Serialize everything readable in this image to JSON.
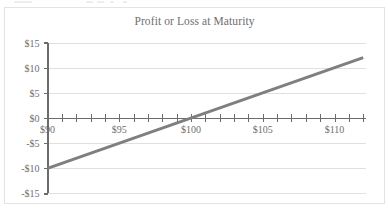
{
  "chart_data": {
    "type": "line",
    "title": "Profit or Loss at Maturity",
    "xlabel": "",
    "ylabel": "",
    "xlim": [
      90,
      112
    ],
    "ylim": [
      -15,
      15
    ],
    "grid": true,
    "legend": null,
    "x_tick_labels": [
      "$90",
      "$95",
      "$100",
      "$105",
      "$110"
    ],
    "x_tick_values": [
      90,
      95,
      100,
      105,
      110
    ],
    "x_minor_tick_step": 1,
    "y_tick_labels": [
      "$15",
      "$10",
      "$5",
      "$0",
      "-$5",
      "-$10",
      "-$15"
    ],
    "y_tick_values": [
      15,
      10,
      5,
      0,
      -5,
      -10,
      -15
    ],
    "series": [
      {
        "name": "Profit or Loss",
        "color": "#7f7f7f",
        "x": [
          90,
          112
        ],
        "values": [
          -10,
          12
        ]
      }
    ],
    "zero_crossing": 100,
    "slope": 1
  },
  "colors": {
    "line": "#7f7f7f",
    "axis": "#6b6b6b",
    "grid": "#e0e0e0",
    "text": "#6e6e6e",
    "border": "#e3e3e3",
    "background": "#ffffff"
  }
}
